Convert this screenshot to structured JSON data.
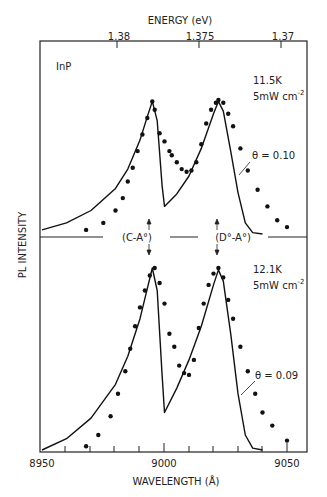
{
  "chart_data": [
    {
      "type": "line",
      "panel": "top",
      "title": "",
      "sample_label": "InP",
      "condition_label": "11.5K",
      "power_label": "5mW cm",
      "power_exp": "-2",
      "fit_label": "θ = 0.10",
      "xlabel": "WAVELENGTH (Å)",
      "ylabel": "PL INTENSITY",
      "xlim": [
        8950,
        9055
      ],
      "peaks": [
        {
          "label": "(C-A°)",
          "wavelength": 8995
        },
        {
          "label": "(D°-A°)",
          "wavelength": 9022
        }
      ],
      "series": [
        {
          "name": "theory (solid line)",
          "x": [
            8950,
            8960,
            8970,
            8980,
            8985,
            8990,
            8993,
            8995,
            8997,
            8999,
            9000,
            9005,
            9010,
            9015,
            9020,
            9022,
            9024,
            9027,
            9030,
            9033,
            9036,
            9040
          ],
          "values": [
            0.03,
            0.08,
            0.17,
            0.33,
            0.47,
            0.68,
            0.85,
            0.96,
            0.82,
            0.35,
            0.2,
            0.29,
            0.42,
            0.62,
            0.87,
            0.96,
            0.89,
            0.6,
            0.3,
            0.08,
            0.01,
            0.0
          ]
        },
        {
          "name": "experiment (dots)",
          "x": [
            8968,
            8975,
            8980,
            8983,
            8985,
            8987,
            8989,
            8991,
            8993,
            8995,
            8996,
            8998,
            9000,
            9002,
            9003,
            9005,
            9007,
            9009,
            9011,
            9013,
            9015,
            9017,
            9019,
            9021,
            9022,
            9024,
            9026,
            9028,
            9031,
            9034,
            9038,
            9042,
            9046,
            9050
          ],
          "values": [
            0.03,
            0.08,
            0.17,
            0.26,
            0.38,
            0.48,
            0.6,
            0.72,
            0.84,
            0.96,
            0.9,
            0.73,
            0.67,
            0.6,
            0.57,
            0.52,
            0.47,
            0.45,
            0.46,
            0.52,
            0.65,
            0.8,
            0.9,
            0.95,
            0.97,
            0.95,
            0.87,
            0.78,
            0.62,
            0.46,
            0.32,
            0.2,
            0.1,
            0.05
          ]
        }
      ]
    },
    {
      "type": "line",
      "panel": "bottom",
      "condition_label": "12.1K",
      "power_label": "5mW cm",
      "power_exp": "-2",
      "fit_label": "θ = 0.09",
      "xlabel": "WAVELENGTH (Å)",
      "ylabel": "PL INTENSITY",
      "xlim": [
        8950,
        9055
      ],
      "series": [
        {
          "name": "theory (solid line)",
          "x": [
            8950,
            8960,
            8970,
            8980,
            8985,
            8990,
            8993,
            8995,
            8997,
            8999,
            9000,
            9005,
            9010,
            9015,
            9020,
            9022,
            9024,
            9027,
            9030,
            9033,
            9036,
            9040
          ],
          "values": [
            0.0,
            0.06,
            0.17,
            0.35,
            0.5,
            0.7,
            0.86,
            0.97,
            0.85,
            0.4,
            0.2,
            0.33,
            0.48,
            0.66,
            0.88,
            0.96,
            0.9,
            0.62,
            0.3,
            0.08,
            0.01,
            0.0
          ]
        },
        {
          "name": "experiment (dots)",
          "x": [
            8968,
            8973,
            8978,
            8981,
            8984,
            8986,
            8988,
            8990,
            8992,
            8994,
            8996,
            8998,
            9000,
            9002,
            9004,
            9006,
            9008,
            9010,
            9012,
            9014,
            9016,
            9018,
            9020,
            9022,
            9024,
            9026,
            9028,
            9031,
            9034,
            9037,
            9040,
            9044,
            9050
          ],
          "values": [
            0.02,
            0.08,
            0.18,
            0.3,
            0.42,
            0.54,
            0.66,
            0.76,
            0.85,
            0.93,
            0.97,
            0.89,
            0.78,
            0.62,
            0.55,
            0.45,
            0.41,
            0.4,
            0.48,
            0.65,
            0.78,
            0.88,
            0.94,
            0.97,
            0.92,
            0.8,
            0.7,
            0.55,
            0.42,
            0.3,
            0.2,
            0.13,
            0.05
          ]
        }
      ]
    }
  ],
  "axes": {
    "top_axis_label": "ENERGY (eV)",
    "top_ticks": [
      "1.38",
      "1.375",
      "1.37"
    ],
    "bottom_axis_label": "WAVELENGTH (Å)",
    "bottom_ticks": [
      "8950",
      "9000",
      "9050"
    ],
    "y_label": "PL INTENSITY"
  }
}
